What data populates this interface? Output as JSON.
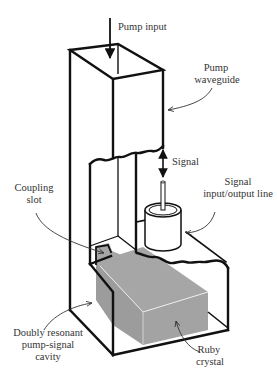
{
  "figure": {
    "type": "technical illustration",
    "colors": {
      "background": "#ffffff",
      "line": "#111111",
      "crystal": "#a6a6a6",
      "crystal_highlight": "#e8e8e8",
      "slot": "#a6a6a6",
      "label_text": "#333333"
    }
  },
  "labels": {
    "pump_input": "Pump input",
    "pump_waveguide_1": "Pump",
    "pump_waveguide_2": "waveguide",
    "signal": "Signal",
    "signal_line_1": "Signal",
    "signal_line_2": "input/output line",
    "coupling_slot_1": "Coupling",
    "coupling_slot_2": "slot",
    "cavity_1": "Doubly resonant",
    "cavity_2": "pump-signal",
    "cavity_3": "cavity",
    "ruby_1": "Ruby",
    "ruby_2": "crystal"
  }
}
